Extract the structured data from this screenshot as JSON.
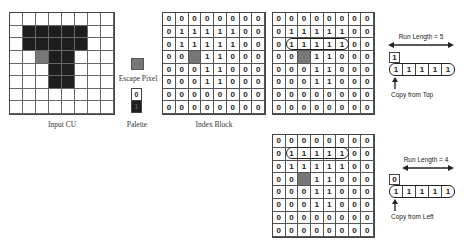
{
  "labels": {
    "input_cu": "Input CU",
    "escape_pixel": "Escape Pixel",
    "palette": "Palette",
    "index_block": "Index Block"
  },
  "colors": {
    "dark": "#1e1e1e",
    "escape": "#777777",
    "white": "#ffffff"
  },
  "input_cu": {
    "rows": [
      [
        "w",
        "w",
        "w",
        "w",
        "w",
        "w",
        "w",
        "w"
      ],
      [
        "w",
        "d",
        "d",
        "d",
        "d",
        "d",
        "w",
        "w"
      ],
      [
        "w",
        "d",
        "d",
        "d",
        "d",
        "d",
        "w",
        "w"
      ],
      [
        "w",
        "w",
        "e",
        "d",
        "d",
        "w",
        "w",
        "w"
      ],
      [
        "w",
        "w",
        "w",
        "d",
        "d",
        "w",
        "w",
        "w"
      ],
      [
        "w",
        "w",
        "w",
        "d",
        "d",
        "w",
        "w",
        "w"
      ],
      [
        "w",
        "w",
        "w",
        "w",
        "w",
        "w",
        "w",
        "w"
      ],
      [
        "w",
        "w",
        "w",
        "w",
        "w",
        "w",
        "w",
        "w"
      ]
    ]
  },
  "palette": {
    "entries": [
      {
        "index": "0",
        "color": "white"
      },
      {
        "index": "1",
        "color": "dark"
      }
    ]
  },
  "index_block": {
    "rows": [
      [
        "0",
        "0",
        "0",
        "0",
        "0",
        "0",
        "0",
        "0"
      ],
      [
        "0",
        "1",
        "1",
        "1",
        "1",
        "1",
        "0",
        "0"
      ],
      [
        "0",
        "1",
        "1",
        "1",
        "1",
        "1",
        "0",
        "0"
      ],
      [
        "0",
        "0",
        "E",
        "1",
        "1",
        "0",
        "0",
        "0"
      ],
      [
        "0",
        "0",
        "0",
        "1",
        "1",
        "0",
        "0",
        "0"
      ],
      [
        "0",
        "0",
        "0",
        "1",
        "1",
        "0",
        "0",
        "0"
      ],
      [
        "0",
        "0",
        "0",
        "0",
        "0",
        "0",
        "0",
        "0"
      ],
      [
        "0",
        "0",
        "0",
        "0",
        "0",
        "0",
        "0",
        "0"
      ]
    ]
  },
  "copy_from_top": {
    "run_length_label": "Run Length = 5",
    "above_value": "1",
    "run_values": [
      "1",
      "1",
      "1",
      "1",
      "1"
    ],
    "caption": "Copy from Top",
    "highlight_row": 2
  },
  "copy_from_left": {
    "run_length_label": "Run Length = 4",
    "above_value": "0",
    "run_values": [
      "1",
      "1",
      "1",
      "1",
      "1"
    ],
    "caption": "Copy from Left",
    "highlight_row": 1
  }
}
